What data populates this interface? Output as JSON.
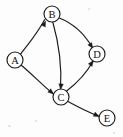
{
  "diagram": {
    "type": "directed-graph",
    "background_color": "#fdfdfd",
    "stroke_color": "#1a1a1a",
    "node_fill_color": "#ffffff",
    "node_radius": 8,
    "width": 123,
    "height": 137,
    "nodes": [
      {
        "id": "A",
        "label": "A",
        "cx": 15,
        "cy": 60
      },
      {
        "id": "B",
        "label": "B",
        "cx": 52,
        "cy": 14
      },
      {
        "id": "C",
        "label": "C",
        "cx": 61,
        "cy": 97
      },
      {
        "id": "D",
        "label": "D",
        "cx": 97,
        "cy": 54
      },
      {
        "id": "E",
        "label": "E",
        "cx": 107,
        "cy": 118
      }
    ],
    "edges": [
      {
        "id": "A-B",
        "from": "A",
        "to": "B",
        "directed": true,
        "path": "M 20.5 54.2 C 28 44 35 37 44.8 19.5"
      },
      {
        "id": "A-C",
        "from": "A",
        "to": "C",
        "directed": true,
        "path": "M 21.3 65.2 C 32 74 41 84 52.5 93.3"
      },
      {
        "id": "B-C",
        "from": "B",
        "to": "C",
        "directed": true,
        "path": "M 52.8 22.0 C 59 44 62 66 60.5 88.8"
      },
      {
        "id": "B-D",
        "from": "B",
        "to": "D",
        "directed": true,
        "path": "M 59.3 18.0 C 72 23 84 33 92.3 47.5"
      },
      {
        "id": "C-D",
        "from": "C",
        "to": "D",
        "directed": true,
        "path": "M 66.6 91.0 C 77 83 86 74 92.8 61.5"
      },
      {
        "id": "C-E",
        "from": "C",
        "to": "E",
        "directed": true,
        "path": "M 68.0 101.5 C 78 107 88 112 98.5 116.2"
      }
    ],
    "arrowheads": [
      {
        "id": "arrow-into-B",
        "edge": "A-B",
        "x": 45.6,
        "y": 21.0,
        "angle": 295
      },
      {
        "id": "arrow-into-C-from-A",
        "edge": "A-C",
        "x": 53.6,
        "y": 94.0,
        "angle": 40
      },
      {
        "id": "arrow-into-C-from-B",
        "edge": "B-C",
        "x": 60.6,
        "y": 89.5,
        "angle": 95
      },
      {
        "id": "arrow-into-D-from-B",
        "edge": "B-D",
        "x": 92.9,
        "y": 48.3,
        "angle": 55
      },
      {
        "id": "arrow-into-D-from-C",
        "edge": "C-D",
        "x": 93.4,
        "y": 60.6,
        "angle": 305
      },
      {
        "id": "arrow-into-E",
        "edge": "C-E",
        "x": 99.3,
        "y": 116.5,
        "angle": 24
      }
    ]
  }
}
